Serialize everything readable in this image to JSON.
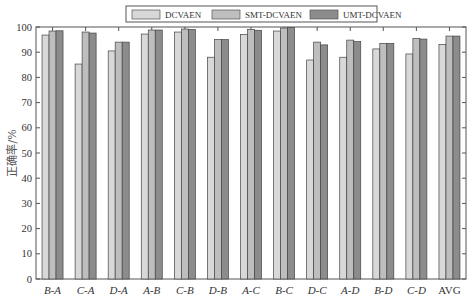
{
  "chart_data": {
    "type": "bar",
    "title": "",
    "xlabel": "",
    "ylabel": "正确率/%",
    "ylim": [
      0,
      100
    ],
    "yticks": [
      0,
      10,
      20,
      30,
      40,
      50,
      60,
      70,
      80,
      90,
      100
    ],
    "grid": false,
    "legend_position": "top-center",
    "categories": [
      "B-A",
      "C-A",
      "D-A",
      "A-B",
      "C-B",
      "D-B",
      "A-C",
      "B-C",
      "D-C",
      "A-D",
      "B-D",
      "C-D",
      "AVG"
    ],
    "italic_categories": [
      true,
      true,
      true,
      true,
      true,
      true,
      true,
      true,
      true,
      true,
      true,
      true,
      false
    ],
    "series": [
      {
        "name": "DCVAEN",
        "color": "#d8d8d8",
        "values": [
          96.8,
          85.3,
          90.5,
          97.2,
          98.0,
          88.0,
          97.0,
          98.4,
          86.9,
          88.0,
          91.3,
          89.3,
          93.1
        ]
      },
      {
        "name": "SMT-DCVAEN",
        "color": "#bebebe",
        "values": [
          98.4,
          98.0,
          94.0,
          98.8,
          99.2,
          95.0,
          99.0,
          99.6,
          94.0,
          94.8,
          93.5,
          95.5,
          96.4
        ]
      },
      {
        "name": "UMT-DCVAEN",
        "color": "#8c8c8c",
        "values": [
          98.5,
          97.6,
          94.0,
          98.8,
          99.0,
          95.0,
          98.7,
          99.8,
          92.9,
          94.2,
          93.5,
          95.2,
          96.4
        ]
      }
    ]
  }
}
